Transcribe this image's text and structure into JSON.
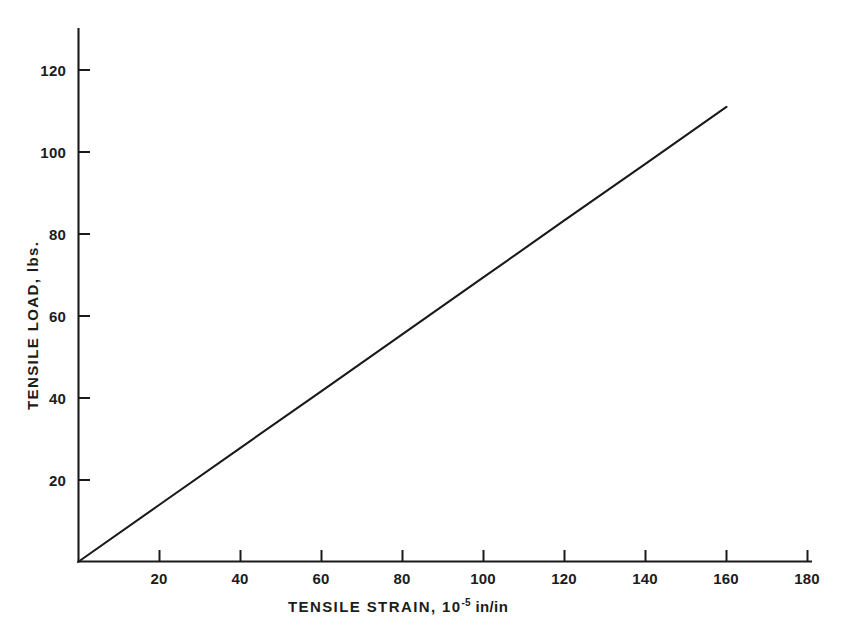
{
  "chart_data": {
    "type": "line",
    "title": "",
    "xlabel": "TENSILE STRAIN, 10-5 in/in",
    "xlabel_prefix": "TENSILE  STRAIN,  10",
    "xlabel_exponent": "-5",
    "xlabel_suffix": " in/in",
    "ylabel": "TENSILE  LOAD, lbs.",
    "xlim": [
      0,
      182
    ],
    "ylim": [
      0,
      127
    ],
    "xticks": [
      20,
      40,
      60,
      80,
      100,
      120,
      140,
      160,
      180
    ],
    "yticks": [
      20,
      40,
      60,
      80,
      100,
      120
    ],
    "xtick_labels": [
      "20",
      "40",
      "60",
      "80",
      "100",
      "120",
      "140",
      "160",
      "180"
    ],
    "ytick_labels": [
      "20",
      "40",
      "60",
      "80",
      "100",
      "120"
    ],
    "grid": false,
    "legend": false,
    "series": [
      {
        "name": "tensile load vs strain",
        "x": [
          0,
          20,
          40,
          60,
          80,
          100,
          120,
          140,
          160
        ],
        "values": [
          0,
          13.9,
          27.8,
          41.6,
          55.5,
          69.4,
          83.3,
          97.1,
          111.0
        ]
      }
    ],
    "line_color": "#1a1a1a",
    "axis_color": "#1a1a1a"
  }
}
